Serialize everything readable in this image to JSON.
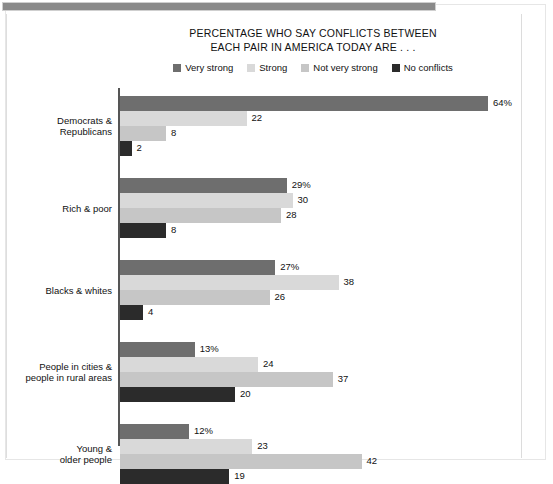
{
  "document": {
    "side_watermark": "",
    "banner_color": "#8a8a8a"
  },
  "chart": {
    "title_line1": "PERCENTAGE WHO SAY CONFLICTS BETWEEN",
    "title_line2": "EACH PAIR IN AMERICA TODAY ARE . . .",
    "legend": [
      {
        "label": "Very strong",
        "color": "#6e6e6e"
      },
      {
        "label": "Strong",
        "color": "#d9d9d9"
      },
      {
        "label": "Not very strong",
        "color": "#c6c6c6"
      },
      {
        "label": "No conflicts",
        "color": "#2b2b2b"
      }
    ]
  },
  "chart_data": {
    "type": "bar",
    "orientation": "horizontal",
    "title": "PERCENTAGE WHO SAY CONFLICTS BETWEEN EACH PAIR IN AMERICA TODAY ARE . . .",
    "xlabel": "",
    "ylabel": "",
    "xlim": [
      0,
      64
    ],
    "grid": false,
    "legend_position": "top-center",
    "categories": [
      "Democrats & Republicans",
      "Rich & poor",
      "Blacks & whites",
      "People in cities & people in rural areas",
      "Young & older people"
    ],
    "category_lines": [
      [
        "Democrats &",
        "Republicans"
      ],
      [
        "Rich & poor"
      ],
      [
        "Blacks & whites"
      ],
      [
        "People in cities &",
        "people in rural areas"
      ],
      [
        "Young &",
        "older people"
      ]
    ],
    "series": [
      {
        "name": "Very strong",
        "color": "#6e6e6e",
        "values": [
          64,
          29,
          27,
          13,
          12
        ]
      },
      {
        "name": "Strong",
        "color": "#d9d9d9",
        "values": [
          22,
          30,
          38,
          24,
          23
        ]
      },
      {
        "name": "Not very strong",
        "color": "#c6c6c6",
        "values": [
          8,
          28,
          26,
          37,
          42
        ]
      },
      {
        "name": "No conflicts",
        "color": "#2b2b2b",
        "values": [
          2,
          8,
          4,
          20,
          19
        ]
      }
    ],
    "data_labels": [
      [
        "64%",
        "22",
        "8",
        "2"
      ],
      [
        "29%",
        "30",
        "28",
        "8"
      ],
      [
        "27%",
        "38",
        "26",
        "4"
      ],
      [
        "13%",
        "24",
        "37",
        "20"
      ],
      [
        "12%",
        "23",
        "42",
        "19"
      ]
    ]
  }
}
